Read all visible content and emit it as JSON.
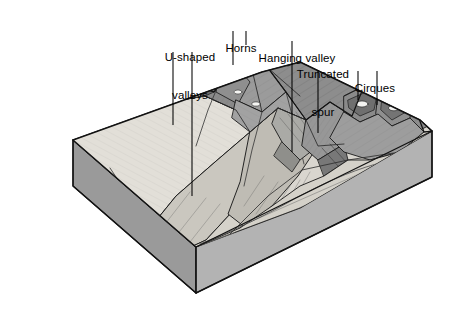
{
  "figure": {
    "type": "isometric-block-diagram",
    "background_color": "#ffffff",
    "style": "grayscale pen-and-ink hatched illustration",
    "width": 458,
    "height": 309
  },
  "palette": {
    "outline": "#1a1a1a",
    "block_side_face": "#9a9a9a",
    "block_front_face": "#b0b0b0",
    "lowland_light": "#d9d6cf",
    "valley_floor": "#cfccc4",
    "mountain_mid": "#9e9e9e",
    "mountain_dark": "#7d7d7d",
    "mountain_darkest": "#626262",
    "snow_white": "#f4f4f2",
    "hatch_line": "#4d4d4d",
    "label_text": "#000000",
    "leader_line": "#000000"
  },
  "labels": [
    {
      "id": "u-shaped-valleys",
      "lines": [
        "U-shaped",
        "valleys"
      ],
      "text": "U-shaped valleys",
      "x": 190,
      "y": 26,
      "align": "center",
      "leaders": [
        {
          "x1": 173,
          "y1": 52,
          "x2": 173,
          "y2": 125
        },
        {
          "x1": 192,
          "y1": 52,
          "x2": 192,
          "y2": 196
        }
      ]
    },
    {
      "id": "horns",
      "lines": [
        "Horns"
      ],
      "text": "Horns",
      "x": 241,
      "y": 18,
      "align": "center",
      "leaders": [
        {
          "x1": 233,
          "y1": 31,
          "x2": 233,
          "y2": 65
        },
        {
          "x1": 246,
          "y1": 31,
          "x2": 246,
          "y2": 45
        }
      ]
    },
    {
      "id": "hanging-valley",
      "lines": [
        "Hanging valley"
      ],
      "text": "Hanging valley",
      "x": 297,
      "y": 28,
      "align": "center",
      "leaders": [
        {
          "x1": 292,
          "y1": 41,
          "x2": 292,
          "y2": 152
        }
      ]
    },
    {
      "id": "truncated-spur",
      "lines": [
        "Truncated",
        "spur"
      ],
      "text": "Truncated spur",
      "x": 323,
      "y": 44,
      "align": "center",
      "leaders": [
        {
          "x1": 318,
          "y1": 70,
          "x2": 318,
          "y2": 133
        }
      ]
    },
    {
      "id": "cirques",
      "lines": [
        "Cirques"
      ],
      "text": "Cirques",
      "x": 375,
      "y": 58,
      "align": "center",
      "leaders": [
        {
          "x1": 358,
          "y1": 71,
          "x2": 358,
          "y2": 100
        },
        {
          "x1": 377,
          "y1": 71,
          "x2": 377,
          "y2": 105
        }
      ]
    }
  ],
  "features": {
    "described": [
      "U-shaped glacial troughs in foreground",
      "Sharp horn peaks along the range crest",
      "Hanging valley entering the main trough",
      "Truncated spur on the valley wall",
      "Cirques with small tarn lakes at the right",
      "Exposed bedrock block sides showing depth"
    ]
  }
}
